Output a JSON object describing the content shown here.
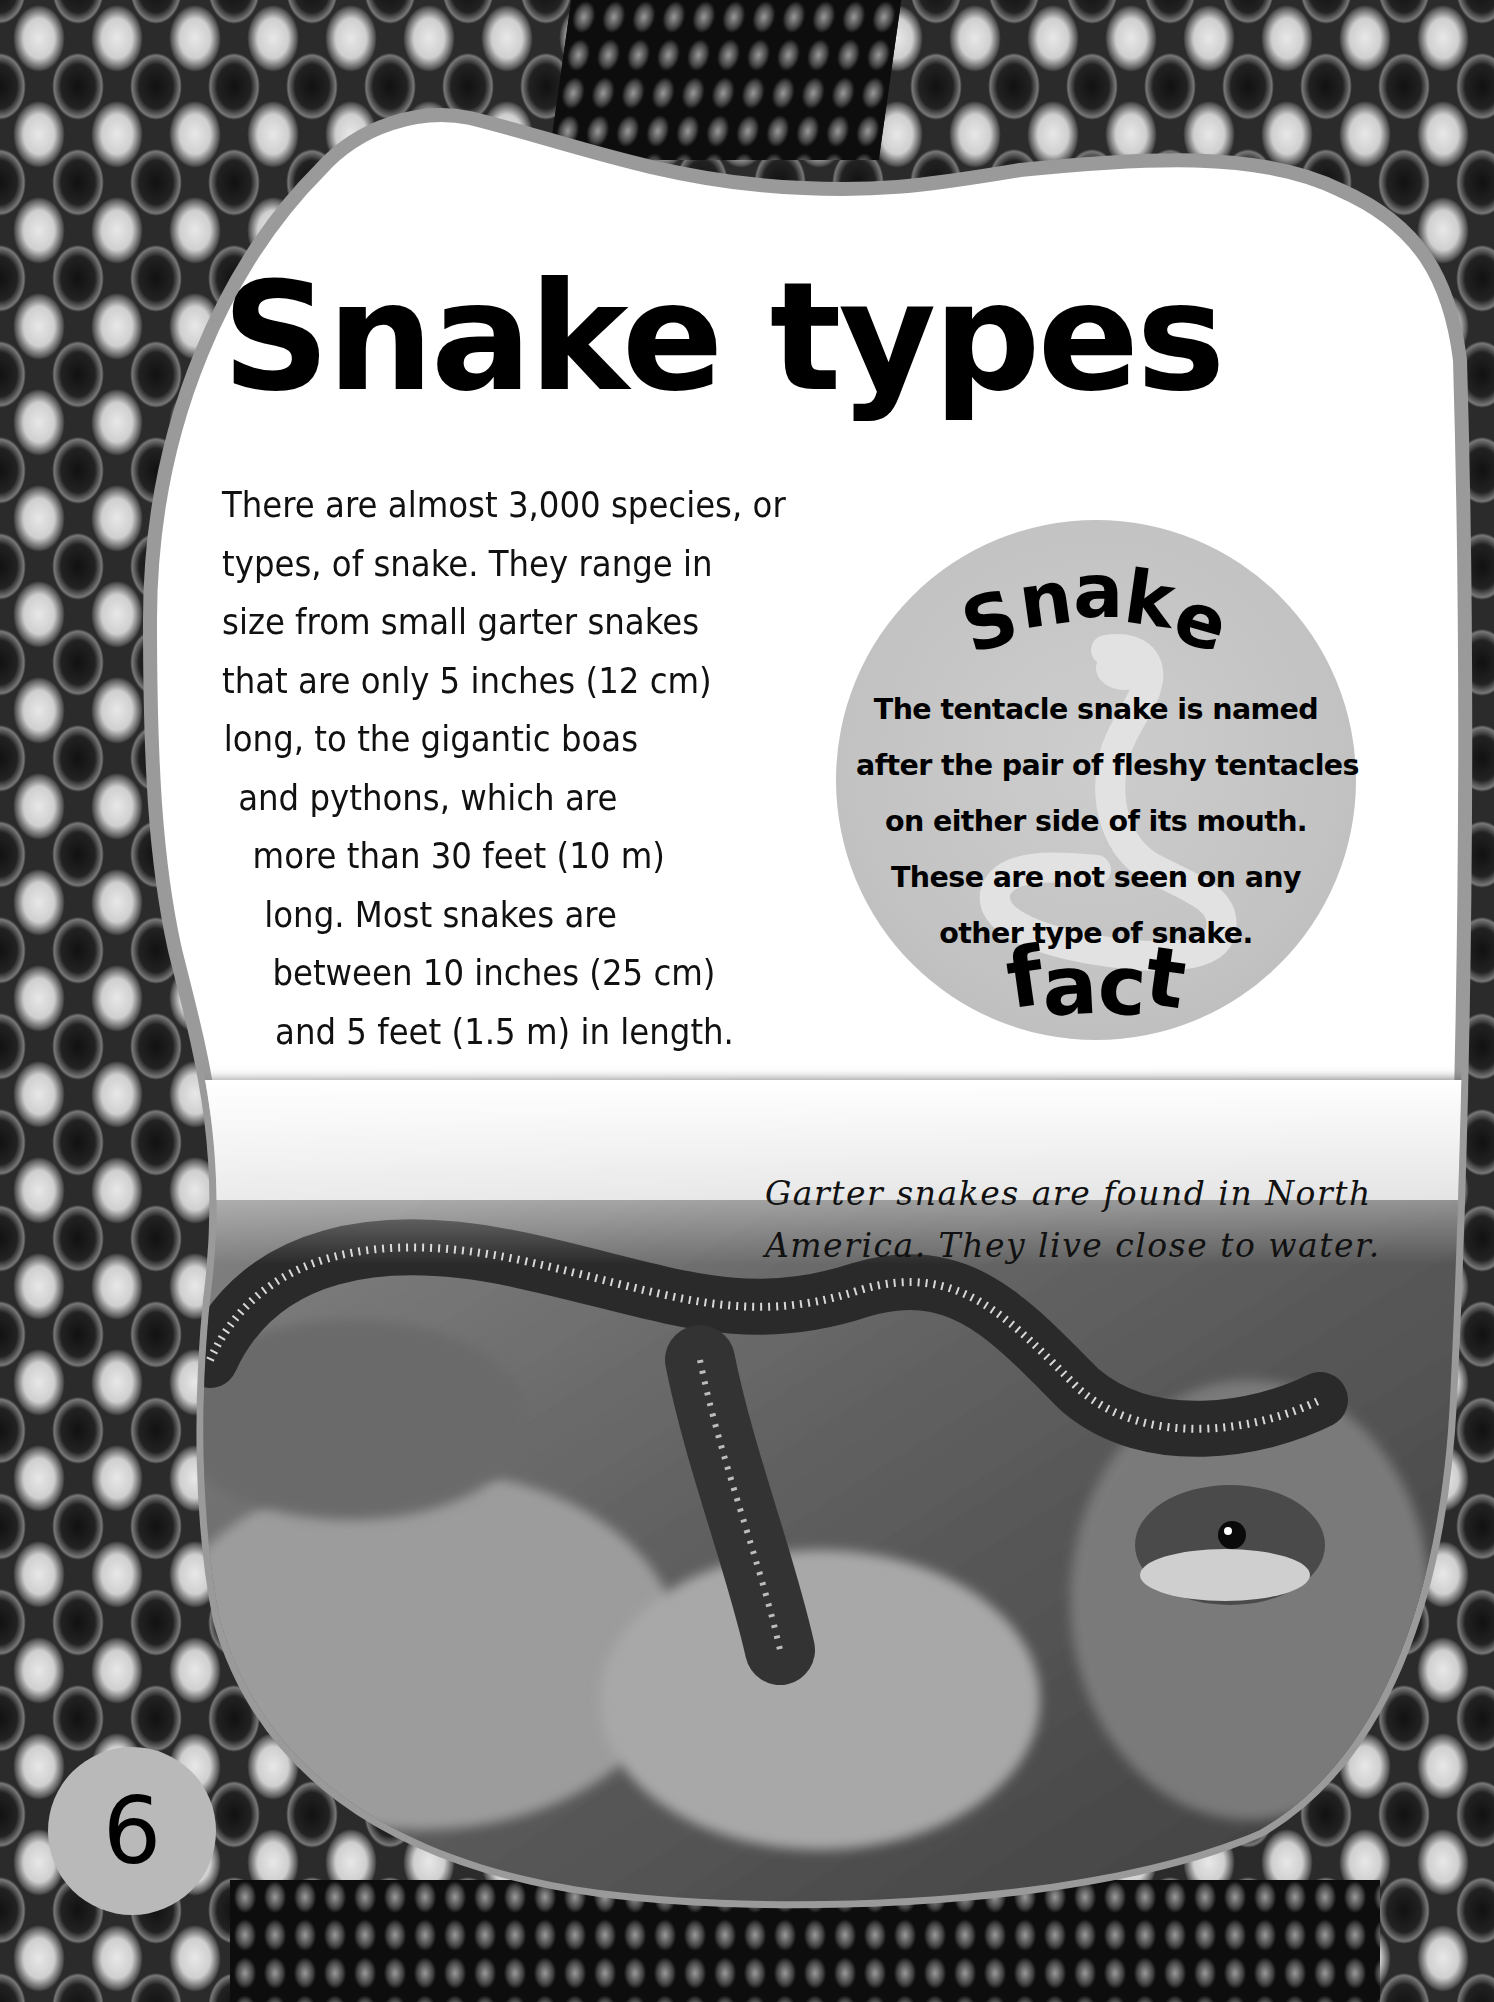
{
  "page": {
    "title": "Snake types",
    "page_number": "6"
  },
  "body": {
    "lines": [
      "There are almost 3,000 species, or",
      "types, of snake. They range in",
      "size from small garter snakes",
      "that are only 5 inches (12 cm)",
      "long, to the gigantic boas",
      "and pythons, which are",
      "more than 30 feet (10 m)",
      "long. Most snakes are",
      "between 10 inches (25 cm)",
      "and 5 feet (1.5 m) in length."
    ]
  },
  "fact_box": {
    "heading_top": [
      "S",
      "n",
      "a",
      "k",
      "e"
    ],
    "heading_bottom": [
      "f",
      "a",
      "c",
      "t"
    ],
    "icon": "cobra-silhouette-icon",
    "lines": [
      "The tentacle snake is named",
      "after the pair of fleshy tentacles",
      "on either side of its mouth.",
      "These are not seen on any",
      "other type of snake."
    ]
  },
  "photo": {
    "subject": "garter snake on rocks",
    "caption_lines": [
      "Garter snakes are found in North",
      "America. They live close to water."
    ]
  },
  "colors": {
    "panel": "#ffffff",
    "panel_outline": "#9a9a9a",
    "fact_circle": "#c4c4c4",
    "page_badge": "#b9b9b9",
    "text": "#000000"
  }
}
